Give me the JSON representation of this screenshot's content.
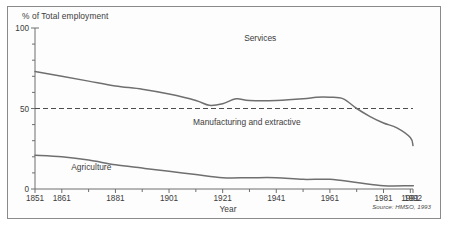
{
  "figure": {
    "frame_color": "#8a8a8a",
    "line_color": "#6f6f6f",
    "text_color": "#3c3c3c",
    "source_note": "Source: HMSO, 1993"
  },
  "chart_data": {
    "type": "line",
    "title": "",
    "xlabel": "Year",
    "ylabel": "% of Total employment",
    "xlim": [
      1851,
      1992
    ],
    "ylim": [
      0,
      100
    ],
    "grid": false,
    "legend": "inline-annotations",
    "xticks": [
      1851,
      1861,
      1871,
      1881,
      1891,
      1901,
      1911,
      1921,
      1931,
      1941,
      1951,
      1961,
      1971,
      1981,
      1991,
      1992
    ],
    "xtick_labels": [
      "1851",
      "1861",
      "",
      "1881",
      "",
      "1901",
      "",
      "1921",
      "",
      "1941",
      "",
      "1961",
      "",
      "1981",
      "1991",
      "1992"
    ],
    "yticks": [
      0,
      10,
      20,
      30,
      40,
      50,
      60,
      70,
      80,
      90,
      100
    ],
    "ytick_labels": [
      "0",
      "",
      "",
      "",
      "",
      "50",
      "",
      "",
      "",
      "",
      "100"
    ],
    "reference_line": {
      "y": 50,
      "style": "dashed"
    },
    "annotations": [
      {
        "text": "Services",
        "x": 1935,
        "y": 92
      },
      {
        "text": "Manufacturing and extractive",
        "x": 1930,
        "y": 40
      },
      {
        "text": "Agriculture",
        "x": 1872,
        "y": 12
      }
    ],
    "series": [
      {
        "name": "Manufacturing and extractive (upper boundary)",
        "x": [
          1851,
          1861,
          1871,
          1881,
          1891,
          1901,
          1911,
          1916,
          1921,
          1926,
          1931,
          1941,
          1951,
          1956,
          1961,
          1966,
          1971,
          1976,
          1981,
          1986,
          1991,
          1992
        ],
        "values": [
          73,
          70,
          67,
          64,
          62,
          59,
          55,
          52,
          53,
          56,
          55,
          55,
          56,
          57,
          57,
          56,
          50,
          45,
          41,
          38,
          32,
          27
        ]
      },
      {
        "name": "Agriculture",
        "x": [
          1851,
          1861,
          1871,
          1881,
          1891,
          1901,
          1911,
          1921,
          1931,
          1941,
          1951,
          1961,
          1971,
          1981,
          1991,
          1992
        ],
        "values": [
          21,
          20,
          18,
          15,
          13,
          11,
          9,
          7,
          7,
          7,
          6,
          6,
          4,
          2,
          2,
          2
        ]
      }
    ]
  }
}
